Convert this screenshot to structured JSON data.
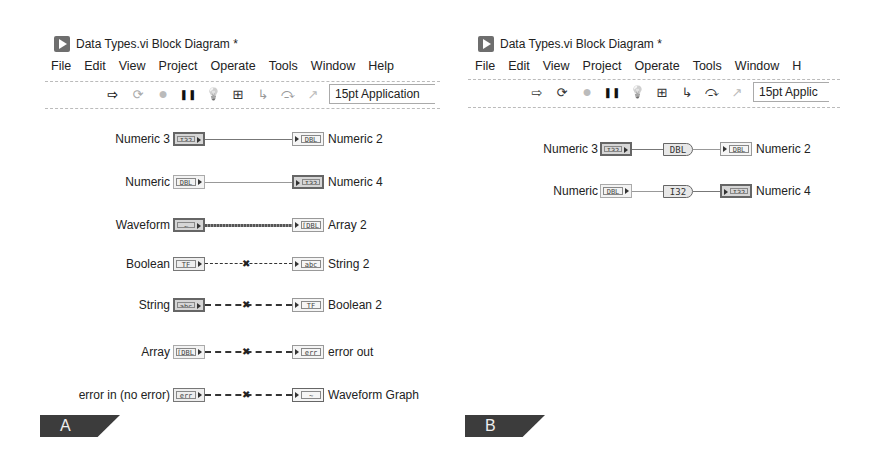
{
  "panels": [
    {
      "id": "A",
      "window_title": "Data Types.vi Block Diagram *",
      "menu": [
        "File",
        "Edit",
        "View",
        "Project",
        "Operate",
        "Tools",
        "Window",
        "Help"
      ],
      "toolbar": {
        "icons": [
          "run-arrow-icon",
          "run-continuously-icon",
          "abort-icon",
          "pause-icon",
          "highlight-execution-icon",
          "retain-wire-values-icon",
          "step-into-icon",
          "step-over-icon",
          "step-out-icon"
        ],
        "font_selector": "15pt Application"
      },
      "rows": [
        {
          "source": "Numeric 3",
          "source_type": "I32",
          "dest": "Numeric 2",
          "dest_type": "DBL",
          "wire": "solid",
          "broken": false
        },
        {
          "source": "Numeric",
          "source_type": "DBL",
          "dest": "Numeric 4",
          "dest_type": "I32",
          "wire": "solid",
          "broken": false
        },
        {
          "source": "Waveform",
          "source_type": "~",
          "dest": "Array 2",
          "dest_type": "[DBL]",
          "wire": "waveform",
          "broken": false
        },
        {
          "source": "Boolean",
          "source_type": "TF",
          "dest": "String 2",
          "dest_type": "abc",
          "wire": "dashed",
          "broken": true
        },
        {
          "source": "String",
          "source_type": "abc",
          "dest": "Boolean 2",
          "dest_type": "TF",
          "wire": "dashed",
          "broken": true
        },
        {
          "source": "Array",
          "source_type": "[DBL]",
          "dest": "error out",
          "dest_type": "err",
          "wire": "dashed",
          "broken": true
        },
        {
          "source": "error in (no error)",
          "source_type": "err",
          "dest": "Waveform Graph",
          "dest_type": "~",
          "wire": "dashed",
          "broken": true
        }
      ],
      "label": "A"
    },
    {
      "id": "B",
      "window_title": "Data Types.vi Block Diagram *",
      "menu": [
        "File",
        "Edit",
        "View",
        "Project",
        "Operate",
        "Tools",
        "Window",
        "H"
      ],
      "toolbar": {
        "icons": [
          "run-arrow-icon",
          "run-continuously-icon",
          "abort-icon",
          "pause-icon",
          "highlight-execution-icon",
          "retain-wire-values-icon",
          "step-into-icon",
          "step-over-icon",
          "step-out-icon"
        ],
        "font_selector": "15pt Applic"
      },
      "rows": [
        {
          "source": "Numeric 3",
          "source_type": "I32",
          "conversion": "DBL",
          "dest": "Numeric 2",
          "dest_type": "DBL"
        },
        {
          "source": "Numeric",
          "source_type": "DBL",
          "conversion": "I32",
          "dest": "Numeric 4",
          "dest_type": "I32"
        }
      ],
      "label": "B"
    }
  ],
  "glyphs": {
    "run-arrow-icon": "⇨",
    "run-continuously-icon": "⟳",
    "abort-icon": "●",
    "pause-icon": "❚❚",
    "highlight-execution-icon": "💡",
    "retain-wire-values-icon": "⊞",
    "step-into-icon": "↳",
    "step-over-icon": "⤼",
    "step-out-icon": "↗",
    "broken-wire-icon": "✖"
  }
}
